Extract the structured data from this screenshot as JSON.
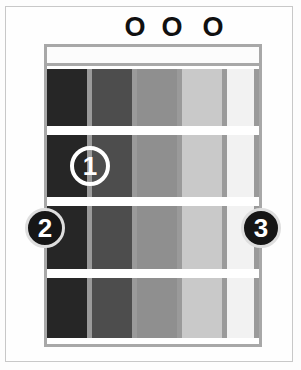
{
  "diagram": {
    "type": "guitar-chord-diagram",
    "title": "",
    "string_count": 6,
    "fret_count": 4,
    "open_markers": [
      {
        "label": "O",
        "x": 122,
        "string_index": 3
      },
      {
        "label": "O",
        "x": 159,
        "string_index": 4
      },
      {
        "label": "O",
        "x": 200,
        "string_index": 5
      }
    ],
    "finger_markers": [
      {
        "label": "1",
        "style": "ring",
        "x": 70,
        "y": 146
      },
      {
        "label": "2",
        "style": "dot",
        "x": 25,
        "y": 208
      },
      {
        "label": "3",
        "style": "dot",
        "x": 241,
        "y": 208
      }
    ],
    "lanes": [
      {
        "name": "lane-1",
        "left": 0,
        "width": 41,
        "color": "#262626"
      },
      {
        "name": "lane-2",
        "left": 45,
        "width": 41,
        "color": "#4d4d4d"
      },
      {
        "name": "lane-3",
        "left": 90,
        "width": 41,
        "color": "#8f8f8f"
      },
      {
        "name": "lane-4",
        "left": 135,
        "width": 41,
        "color": "#c9c9c9"
      },
      {
        "name": "lane-5",
        "left": 180,
        "width": 32,
        "color": "#f2f2f2"
      }
    ],
    "string_lines": [
      {
        "name": "string-line-1",
        "left": 40
      },
      {
        "name": "string-line-2",
        "left": 85
      },
      {
        "name": "string-line-3",
        "left": 130
      },
      {
        "name": "string-line-4",
        "left": 175
      },
      {
        "name": "string-line-5",
        "left": 207
      }
    ],
    "fret_lines": [
      {
        "name": "fret-line-1",
        "top": 57
      },
      {
        "name": "fret-line-2",
        "top": 128
      },
      {
        "name": "fret-line-3",
        "top": 200
      },
      {
        "name": "fret-line-4",
        "top": 269
      }
    ],
    "colors": {
      "frame": "#a8a8a8",
      "nut": "#fcfcfc",
      "fret": "#ffffff",
      "string": "#9a9a9a",
      "marker_fill": "#161616",
      "marker_text": "#ffffff",
      "open_marker_text": "#101010",
      "background": "#fefefe",
      "outer_border": "#c8c8c8"
    }
  }
}
